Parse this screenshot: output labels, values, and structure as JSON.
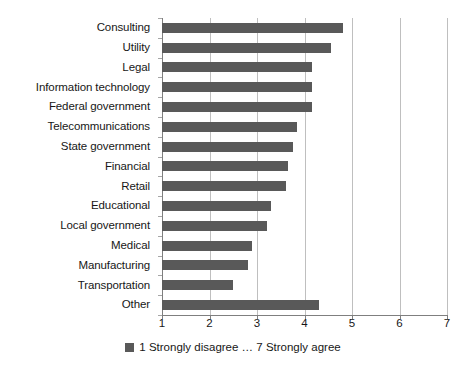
{
  "chart_data": {
    "type": "bar",
    "orientation": "horizontal",
    "title": "",
    "subtitle": "",
    "xlabel": "",
    "ylabel": "",
    "xlim": [
      1,
      7
    ],
    "xticks": [
      1,
      2,
      3,
      4,
      5,
      6,
      7
    ],
    "grid": true,
    "legend_position": "bottom",
    "categories": [
      "Consulting",
      "Utility",
      "Legal",
      "Information technology",
      "Federal government",
      "Telecommunications",
      "State government",
      "Financial",
      "Retail",
      "Educational",
      "Local government",
      "Medical",
      "Manufacturing",
      "Transportation",
      "Other"
    ],
    "values": [
      4.8,
      4.55,
      4.15,
      4.15,
      4.15,
      3.85,
      3.75,
      3.65,
      3.6,
      3.3,
      3.2,
      2.9,
      2.8,
      2.5,
      4.3
    ],
    "series": [
      {
        "name": "1 Strongly disagree ... 7 Strongly agree",
        "color": "#595959",
        "values": [
          4.8,
          4.55,
          4.15,
          4.15,
          4.15,
          3.85,
          3.75,
          3.65,
          3.6,
          3.3,
          3.2,
          2.9,
          2.8,
          2.5,
          4.3
        ]
      }
    ]
  },
  "legend": {
    "label": "1 Strongly disagree … 7 Strongly agree",
    "swatch_color": "#595959"
  },
  "axis": {
    "tick_labels": [
      "1",
      "2",
      "3",
      "4",
      "5",
      "6",
      "7"
    ],
    "line_color": "#7f7f7f",
    "gridline_color": "#bfbfbf"
  }
}
